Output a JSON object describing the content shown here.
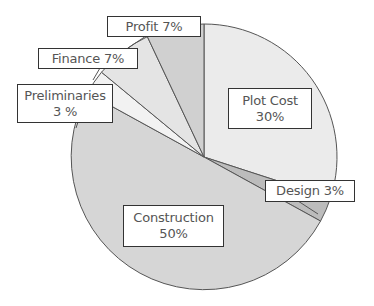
{
  "chart_data": {
    "type": "pie",
    "title": "",
    "start_angle_deg": 0,
    "direction": "clockwise",
    "slices": [
      {
        "name": "Plot Cost",
        "value": 30,
        "label_line1": "Plot Cost",
        "label_line2": "30%",
        "color": "#ebebeb"
      },
      {
        "name": "Design",
        "value": 3,
        "label_line1": "Design 3%",
        "label_line2": "",
        "color": "#bcbcbc"
      },
      {
        "name": "Construction",
        "value": 50,
        "label_line1": "Construction",
        "label_line2": "50%",
        "color": "#d6d6d6"
      },
      {
        "name": "Preliminaries",
        "value": 3,
        "label_line1": "Preliminaries",
        "label_line2": "3 %",
        "color": "#f2f2f2"
      },
      {
        "name": "Finance",
        "value": 7,
        "label_line1": "Finance 7%",
        "label_line2": "",
        "color": "#e4e4e4"
      },
      {
        "name": "Profit",
        "value": 7,
        "label_line1": "Profit 7%",
        "label_line2": "",
        "color": "#d0d0d0"
      }
    ],
    "legend": "none",
    "units": "%"
  },
  "style": {
    "outline_color": "#555555",
    "label_border": "#333333",
    "label_text": "#555555"
  }
}
